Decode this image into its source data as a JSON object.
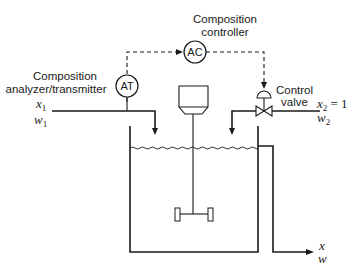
{
  "diagram": {
    "type": "process-control-schematic",
    "labels": {
      "controller_title_line1": "Composition",
      "controller_title_line2": "controller",
      "controller_tag": "AC",
      "analyzer_title_line1": "Composition",
      "analyzer_title_line2": "analyzer/transmitter",
      "analyzer_tag": "AT",
      "valve_title_line1": "Control",
      "valve_title_line2": "valve"
    },
    "streams": {
      "inlet1": {
        "x_label": "x",
        "x_sub": "1",
        "w_label": "w",
        "w_sub": "1"
      },
      "inlet2": {
        "x_label": "x",
        "x_sub": "2",
        "x_value": " = 1",
        "w_label": "w",
        "w_sub": "2"
      },
      "outlet": {
        "x_label": "x",
        "w_label": "w"
      }
    },
    "colors": {
      "line": "#1a1a1a",
      "background": "#ffffff"
    }
  }
}
